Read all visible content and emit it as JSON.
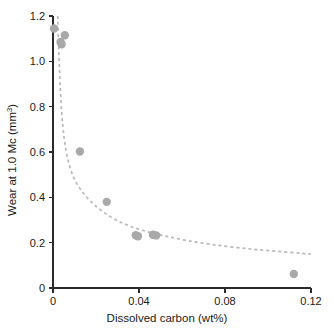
{
  "chart_data": {
    "type": "scatter",
    "title": "",
    "xlabel": "Dissolved carbon (wt%)",
    "ylabel": "Wear at 1.0 Mc (mm3)",
    "ylabel_base": "Wear at 1.0 Mc (mm",
    "ylabel_sup": "3",
    "ylabel_close": ")",
    "xlim": [
      0,
      0.12
    ],
    "ylim": [
      0,
      1.2
    ],
    "grid": false,
    "legend": null,
    "xticks": [
      0,
      0.04,
      0.08,
      0.12
    ],
    "xtick_labels": [
      "0",
      "0.04",
      "0.08",
      "0.12"
    ],
    "yticks": [
      0,
      0.2,
      0.4,
      0.6,
      0.8,
      1.0,
      1.2
    ],
    "ytick_labels": [
      "0",
      "0.2",
      "0.4",
      "0.6",
      "0.8",
      "1.0",
      "1.2"
    ],
    "marker": "circle",
    "marker_color": "#a9a9a9",
    "marker_radius_px": 4.2,
    "trend_style": "dashed",
    "trend_color": "#b8b8b8",
    "points": [
      {
        "x": 0.0005,
        "y": 1.145
      },
      {
        "x": 0.0035,
        "y": 1.085
      },
      {
        "x": 0.004,
        "y": 1.075
      },
      {
        "x": 0.0055,
        "y": 1.115
      },
      {
        "x": 0.0125,
        "y": 0.602
      },
      {
        "x": 0.025,
        "y": 0.38
      },
      {
        "x": 0.0385,
        "y": 0.233
      },
      {
        "x": 0.0395,
        "y": 0.228
      },
      {
        "x": 0.0465,
        "y": 0.235
      },
      {
        "x": 0.048,
        "y": 0.232
      },
      {
        "x": 0.112,
        "y": 0.062
      }
    ],
    "trend_curve": [
      {
        "x": 0.0022,
        "y": 1.2
      },
      {
        "x": 0.0028,
        "y": 1.02
      },
      {
        "x": 0.0035,
        "y": 0.86
      },
      {
        "x": 0.0045,
        "y": 0.72
      },
      {
        "x": 0.006,
        "y": 0.61
      },
      {
        "x": 0.008,
        "y": 0.53
      },
      {
        "x": 0.0105,
        "y": 0.47
      },
      {
        "x": 0.014,
        "y": 0.42
      },
      {
        "x": 0.018,
        "y": 0.378
      },
      {
        "x": 0.023,
        "y": 0.338
      },
      {
        "x": 0.029,
        "y": 0.302
      },
      {
        "x": 0.036,
        "y": 0.272
      },
      {
        "x": 0.044,
        "y": 0.248
      },
      {
        "x": 0.053,
        "y": 0.228
      },
      {
        "x": 0.063,
        "y": 0.208
      },
      {
        "x": 0.074,
        "y": 0.192
      },
      {
        "x": 0.086,
        "y": 0.178
      },
      {
        "x": 0.099,
        "y": 0.166
      },
      {
        "x": 0.12,
        "y": 0.15
      }
    ]
  }
}
